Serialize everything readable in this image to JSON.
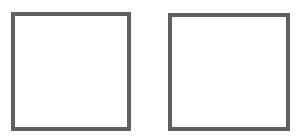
{
  "shapes": [
    {
      "type": "square",
      "fill": "#ffffff",
      "stroke": "#5f5f5f"
    },
    {
      "type": "square",
      "fill": "#ffffff",
      "stroke": "#5f5f5f"
    }
  ]
}
